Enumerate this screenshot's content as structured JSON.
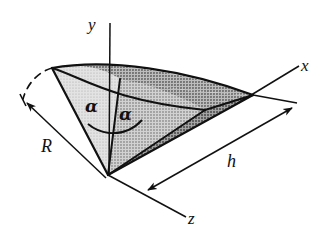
{
  "figure": {
    "caption": "Right circular cone with apex at origin, axis along x, half-angle alpha, base radius R, height h",
    "background_color": "#ffffff",
    "ink_color": "#111111"
  },
  "axes": [
    {
      "name": "y",
      "label": "y",
      "direction": "up"
    },
    {
      "name": "x",
      "label": "x",
      "direction": "upper-right"
    },
    {
      "name": "z",
      "label": "z",
      "direction": "lower-right"
    }
  ],
  "dimensions": [
    {
      "name": "radius",
      "label": "R",
      "arrow": "single",
      "description": "slant/base radius measured to upper-left"
    },
    {
      "name": "height",
      "label": "h",
      "arrow": "double",
      "description": "axial height measured along the cone axis"
    }
  ],
  "angles": [
    {
      "name": "half-angle-left",
      "label": "α"
    },
    {
      "name": "half-angle-right",
      "label": "α"
    }
  ],
  "shading": {
    "light_gray": "#d8d8d8",
    "mid_gray": "#b9b9b9",
    "dark_gray": "#8f8f8f",
    "darker_gray": "#7a7a7a"
  }
}
